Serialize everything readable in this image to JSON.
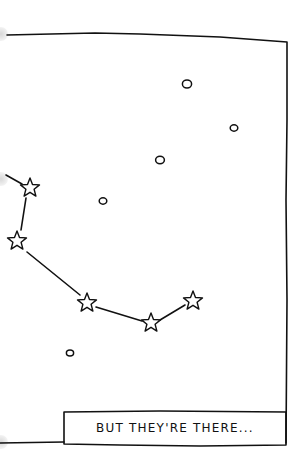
{
  "comic_panel": {
    "caption": "BUT THEY'RE THERE...",
    "colors": {
      "ink": "#111111",
      "background": "#ffffff"
    },
    "dim_stars": [
      {
        "x": 187,
        "y": 84,
        "r": 4
      },
      {
        "x": 234,
        "y": 128,
        "r": 3.2
      },
      {
        "x": 160,
        "y": 160,
        "r": 3.8
      },
      {
        "x": 103,
        "y": 201,
        "r": 3.2
      },
      {
        "x": 70,
        "y": 353,
        "r": 3
      }
    ],
    "constellation_stars": [
      {
        "x": 30,
        "y": 188
      },
      {
        "x": 17,
        "y": 241
      },
      {
        "x": 87,
        "y": 303
      },
      {
        "x": 151,
        "y": 323
      },
      {
        "x": 193,
        "y": 301
      }
    ]
  }
}
